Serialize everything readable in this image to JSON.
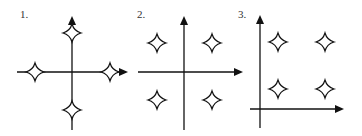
{
  "panels": [
    {
      "label": "1.",
      "label_pos": [
        20,
        8
      ],
      "axes": {
        "vx": 72,
        "vy1": 16,
        "vy2": 130,
        "hy": 72,
        "hx1": 17,
        "hx2": 128
      },
      "stars": [
        [
          72,
          33
        ],
        [
          35,
          72
        ],
        [
          110,
          72
        ],
        [
          72,
          110
        ]
      ]
    },
    {
      "label": "2.",
      "label_pos": [
        137,
        8
      ],
      "axes": {
        "vx": 184,
        "vy1": 16,
        "vy2": 130,
        "hy": 72,
        "hx1": 138,
        "hx2": 243
      },
      "stars": [
        [
          157,
          43
        ],
        [
          212,
          43
        ],
        [
          157,
          100
        ],
        [
          212,
          100
        ]
      ]
    },
    {
      "label": "3.",
      "label_pos": [
        238,
        8
      ],
      "axes": {
        "vx": 260,
        "vy1": 15,
        "vy2": 128,
        "hy": 109,
        "hx1": 250,
        "hx2": 344
      },
      "stars": [
        [
          278,
          42
        ],
        [
          325,
          42
        ],
        [
          278,
          89
        ],
        [
          325,
          89
        ]
      ]
    }
  ],
  "colors": {
    "stroke": "#111111",
    "star_fill": "#ffffff"
  }
}
